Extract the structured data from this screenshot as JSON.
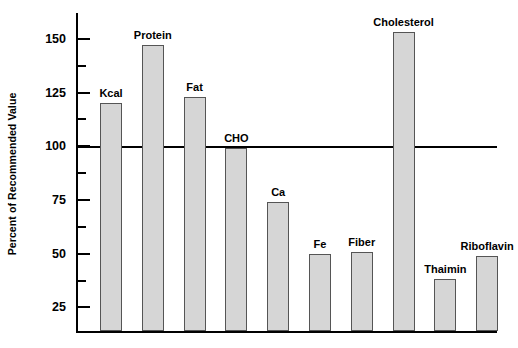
{
  "chart_data": {
    "type": "bar",
    "title": "",
    "subtitle": "",
    "xlabel": "",
    "ylabel": "Percent of Recommended Value",
    "categories": [
      "Kcal",
      "Protein",
      "Fat",
      "CHO",
      "Ca",
      "Fe",
      "Fiber",
      "Cholesterol",
      "Thaimin",
      "Riboflavin"
    ],
    "values": [
      120,
      147,
      123,
      99,
      74,
      50,
      51,
      153,
      38,
      49
    ],
    "ylim": [
      14,
      162
    ],
    "y_major_ticks": [
      25,
      50,
      75,
      100,
      125,
      150
    ],
    "y_minor_ticks": [
      37.5,
      62.5,
      87.5,
      112.5,
      137.5,
      162.5
    ],
    "y_tick_labels": [
      "25",
      "50",
      "75",
      "100",
      "125",
      "150"
    ],
    "reference_line": 100,
    "grid": false,
    "legend": "none",
    "bar_fill_color": "#d6d6d6",
    "bar_border_color": "#555555",
    "axis_color": "#000000",
    "background_color": "#ffffff",
    "data_labels_position": "above-bar"
  }
}
